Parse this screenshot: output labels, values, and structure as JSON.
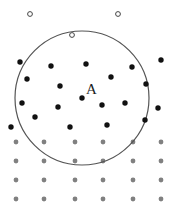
{
  "diagram": {
    "colors": {
      "background": "#ffffff",
      "boundary_circle": "#555555",
      "black_dot": "#111111",
      "grey_dot": "#808080",
      "hollow_dot_stroke": "#444444"
    },
    "boundary_circle": {
      "cx": 82,
      "cy": 98,
      "r": 67
    },
    "center_label": {
      "text": "A",
      "x": 86,
      "y": 94
    },
    "hollow_points": [
      {
        "x": 30,
        "y": 14
      },
      {
        "x": 118,
        "y": 14
      },
      {
        "x": 72,
        "y": 35
      }
    ],
    "black_points": [
      {
        "x": 20,
        "y": 62
      },
      {
        "x": 51,
        "y": 66
      },
      {
        "x": 86,
        "y": 64
      },
      {
        "x": 132,
        "y": 67
      },
      {
        "x": 161,
        "y": 60
      },
      {
        "x": 27,
        "y": 79
      },
      {
        "x": 111,
        "y": 77
      },
      {
        "x": 146,
        "y": 84
      },
      {
        "x": 60,
        "y": 86
      },
      {
        "x": 82,
        "y": 98
      },
      {
        "x": 22,
        "y": 103
      },
      {
        "x": 58,
        "y": 107
      },
      {
        "x": 102,
        "y": 105
      },
      {
        "x": 125,
        "y": 103
      },
      {
        "x": 158,
        "y": 108
      },
      {
        "x": 35,
        "y": 117
      },
      {
        "x": 145,
        "y": 120
      },
      {
        "x": 11,
        "y": 127
      },
      {
        "x": 70,
        "y": 127
      },
      {
        "x": 107,
        "y": 125
      }
    ],
    "grey_grid": {
      "columns_x": [
        16,
        44,
        75,
        103,
        133,
        161
      ],
      "rows_y": [
        142,
        161,
        180,
        199
      ]
    }
  }
}
